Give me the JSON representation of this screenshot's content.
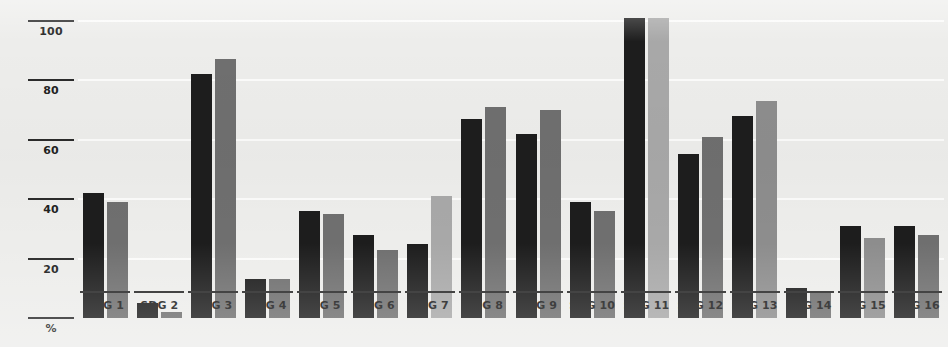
{
  "chart_data": {
    "type": "bar",
    "title": "",
    "xlabel": "",
    "ylabel": "%",
    "ylim": [
      0,
      105
    ],
    "yticks": [
      20,
      40,
      60,
      80,
      100
    ],
    "grid": true,
    "legend": "none",
    "axis_caption": "%",
    "categories": [
      "SDG 1",
      "SDG 2",
      "SDG 3",
      "SDG 4",
      "SDG 5",
      "SDG 6",
      "SDG 7",
      "SDG 8",
      "SDG 9",
      "SDG 10",
      "SDG 11",
      "SDG 12",
      "SDG 13",
      "SDG 14",
      "SDG 15",
      "SDG 16"
    ],
    "series": [
      {
        "name": "series-dark",
        "color": "#1d1d1d",
        "values": [
          42,
          5,
          82,
          13,
          36,
          28,
          25,
          67,
          62,
          39,
          101,
          55,
          68,
          10,
          31,
          31
        ]
      },
      {
        "name": "series-light",
        "color": "#6f6f6f",
        "values": [
          39,
          2,
          87,
          13,
          35,
          23,
          41,
          71,
          70,
          36,
          101,
          61,
          73,
          9,
          27,
          28
        ]
      }
    ],
    "series_light_shade_overrides": {
      "6": "#a8a8a8",
      "10": "#a8a8a8",
      "12": "#8d8d8d",
      "14": "#8d8d8d"
    }
  },
  "colors": {
    "background": "#ededeb",
    "bar_dark": "#1d1d1d",
    "bar_light": "#6f6f6f",
    "bar_pale": "#a8a8a8",
    "axis": "#2b2b2b",
    "gridline": "#ffffff"
  }
}
